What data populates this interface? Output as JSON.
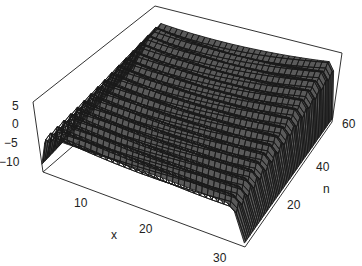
{
  "chart_data": {
    "type": "surface3d",
    "title": "",
    "xlabel": "x",
    "ylabel": "n",
    "zlabel": "",
    "x_range": [
      1,
      32
    ],
    "y_range": [
      1,
      64
    ],
    "z_range": [
      -12,
      6
    ],
    "x_ticks": [
      "10",
      "20",
      "30"
    ],
    "y_ticks": [
      "20",
      "40",
      "60"
    ],
    "z_ticks": [
      "5",
      "0",
      "−5",
      "−10"
    ],
    "colors": {
      "mesh": "#1a1a1a",
      "cell": "#5a5a5a",
      "box": "#333333",
      "background": "#ffffff"
    },
    "grid": false,
    "legend": null
  },
  "axes": {
    "z_ticks": [
      {
        "label": "5"
      },
      {
        "label": "0"
      },
      {
        "label": "−5"
      },
      {
        "label": "−10"
      }
    ],
    "x_ticks": [
      {
        "label": "10"
      },
      {
        "label": "20"
      },
      {
        "label": "30"
      }
    ],
    "n_ticks": [
      {
        "label": "20"
      },
      {
        "label": "40"
      },
      {
        "label": "60"
      }
    ],
    "x_title": "x",
    "n_title": "n"
  }
}
